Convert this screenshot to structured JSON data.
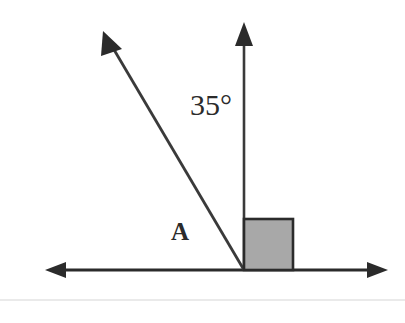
{
  "diagram": {
    "background_color": "#ffffff",
    "stroke_color": "#2b2b2b",
    "labels": {
      "angle_measure": "35°",
      "angle_region": "A"
    },
    "shapes": {
      "right_angle_marker": {
        "name": "right-angle-square",
        "fill_color": "#a8a8a8",
        "border_color": "#2b2b2b",
        "x": 243,
        "y": 218,
        "width": 50,
        "height": 52
      },
      "vertex": {
        "x": 244,
        "y": 270
      },
      "horizontal_axis": {
        "name": "horizontal-double-arrow",
        "x1": 45,
        "y1": 270,
        "x2": 388,
        "y2": 270
      },
      "vertical_ray": {
        "name": "vertical-ray",
        "x1": 244,
        "y1": 270,
        "x2": 244,
        "y2": 24
      },
      "diagonal_ray": {
        "name": "diagonal-ray",
        "x1": 244,
        "y1": 270,
        "x2": 106,
        "y2": 36
      },
      "separator_line": {
        "name": "bottom-separator",
        "color": "#e3e3e3",
        "y": 300
      }
    }
  }
}
